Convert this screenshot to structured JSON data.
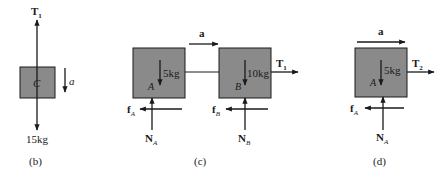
{
  "colors": {
    "box_fill": "#8a8a8a",
    "line": "#1a1a1a",
    "background": "#ffffff"
  },
  "panel_b": {
    "caption": "(b)",
    "box_label": "C",
    "mass": "15kg",
    "tension": "T",
    "tension_sub": "1",
    "accel": "a"
  },
  "panel_c": {
    "caption": "(c)",
    "accel": "a",
    "block_a": {
      "label": "A",
      "mass": "5kg",
      "friction": "f",
      "friction_sub": "A",
      "normal": "N",
      "normal_sub": "A"
    },
    "block_b": {
      "label": "B",
      "mass": "10kg",
      "friction": "f",
      "friction_sub": "B",
      "normal": "N",
      "normal_sub": "B"
    },
    "tension": "T",
    "tension_sub": "1"
  },
  "panel_d": {
    "caption": "(d)",
    "accel": "a",
    "block_a": {
      "label": "A",
      "mass": "5kg",
      "friction": "f",
      "friction_sub": "A",
      "normal": "N",
      "normal_sub": "A"
    },
    "tension": "T",
    "tension_sub": "2"
  }
}
